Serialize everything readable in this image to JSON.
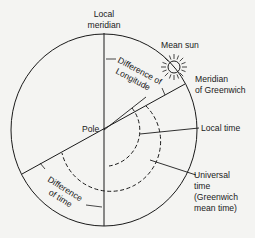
{
  "diagram": {
    "type": "celestial-time-diagram",
    "colors": {
      "ink": "#1a1a1a",
      "background": "#f4f4f2"
    },
    "labels": {
      "local_meridian_line1": "Local",
      "local_meridian_line2": "meridian",
      "mean_sun": "Mean sun",
      "meridian_greenwich_line1": "Meridian",
      "meridian_greenwich_line2": "of Greenwich",
      "difference_longitude_line1": "Difference of",
      "difference_longitude_line2": "Longitude",
      "pole": "Pole",
      "local_time": "Local time",
      "universal_time_line1": "Universal",
      "universal_time_line2": "time",
      "universal_time_line3": "(Greenwich",
      "universal_time_line4": "mean time)",
      "difference_time_line1": "Difference",
      "difference_time_line2": "of time"
    },
    "icons": {
      "sun": "sun-icon"
    }
  }
}
